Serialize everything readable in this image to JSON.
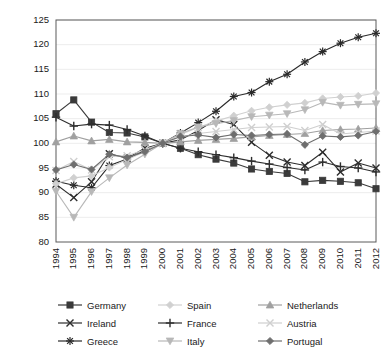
{
  "chart_data": {
    "type": "line",
    "title": "",
    "subtitle": "",
    "xlabel": "",
    "ylabel": "",
    "ylim": [
      80,
      125
    ],
    "yticks": [
      80,
      85,
      90,
      95,
      100,
      105,
      110,
      115,
      120,
      125
    ],
    "grid": true,
    "legend_position": "bottom",
    "legend_columns": 3,
    "x": [
      1994,
      1995,
      1996,
      1997,
      1998,
      1999,
      2000,
      2001,
      2002,
      2003,
      2004,
      2005,
      2006,
      2007,
      2008,
      2009,
      2010,
      2011,
      2012
    ],
    "categories": [
      "1994",
      "1995",
      "1996",
      "1997",
      "1998",
      "1999",
      "2000",
      "2001",
      "2002",
      "2003",
      "2004",
      "2005",
      "2006",
      "2007",
      "2008",
      "2009",
      "2010",
      "2011",
      "2012"
    ],
    "series": [
      {
        "name": "Germany",
        "marker": "square",
        "color": "#3a3a3a",
        "values": [
          106.0,
          108.8,
          104.3,
          102.2,
          102.1,
          101.3,
          100.0,
          99.0,
          97.7,
          96.8,
          96.0,
          94.8,
          94.3,
          93.9,
          92.2,
          92.5,
          92.3,
          92.0,
          90.8
        ]
      },
      {
        "name": "Ireland",
        "marker": "x",
        "color": "#2e2e2e",
        "values": [
          91.7,
          89.0,
          92.2,
          97.9,
          97.0,
          99.0,
          100.0,
          100.7,
          102.6,
          104.8,
          103.8,
          100.2,
          97.6,
          96.2,
          95.5,
          98.2,
          94.2,
          96.0,
          95.0
        ]
      },
      {
        "name": "Greece",
        "marker": "asterisk",
        "color": "#2a2a2a",
        "values": [
          92.3,
          91.5,
          91.0,
          95.5,
          96.8,
          98.6,
          100.0,
          102.1,
          104.2,
          106.5,
          109.5,
          110.3,
          112.5,
          114.0,
          116.5,
          118.6,
          120.3,
          121.5,
          122.3
        ]
      },
      {
        "name": "Spain",
        "marker": "diamond",
        "color": "#d0d0d0",
        "values": [
          91.8,
          93.0,
          93.4,
          95.1,
          96.7,
          98.3,
          100.0,
          101.8,
          103.2,
          104.5,
          105.6,
          106.6,
          107.3,
          107.8,
          108.2,
          109.1,
          109.4,
          109.6,
          110.2
        ]
      },
      {
        "name": "France",
        "marker": "plus",
        "color": "#2e2e2e",
        "values": [
          105.3,
          103.5,
          103.9,
          103.7,
          102.8,
          101.5,
          100.0,
          99.0,
          98.3,
          97.7,
          97.1,
          96.4,
          95.8,
          95.1,
          94.6,
          96.2,
          95.3,
          95.0,
          94.2
        ]
      },
      {
        "name": "Italy",
        "marker": "triangle-down",
        "color": "#b8b8b8",
        "values": [
          90.3,
          85.0,
          90.2,
          93.0,
          95.6,
          97.8,
          100.0,
          102.0,
          103.3,
          104.0,
          104.6,
          105.4,
          105.7,
          106.0,
          106.8,
          108.3,
          107.7,
          107.9,
          108.0
        ]
      },
      {
        "name": "Netherlands",
        "marker": "triangle-up",
        "color": "#a0a0a0",
        "values": [
          100.3,
          101.5,
          100.5,
          100.8,
          100.3,
          100.2,
          100.0,
          100.3,
          100.6,
          100.8,
          101.0,
          101.3,
          101.6,
          101.8,
          102.0,
          102.6,
          102.8,
          102.9,
          103.1
        ]
      },
      {
        "name": "Austria",
        "marker": "x-light",
        "color": "#cfcfcf",
        "values": [
          94.5,
          96.3,
          94.6,
          97.3,
          97.5,
          98.7,
          100.0,
          101.3,
          102.0,
          102.4,
          102.8,
          103.2,
          103.3,
          103.4,
          102.6,
          103.8,
          101.9,
          102.2,
          102.5
        ]
      },
      {
        "name": "Portugal",
        "marker": "diamond-dark",
        "color": "#6e6e6e",
        "values": [
          94.6,
          95.7,
          94.7,
          97.8,
          97.1,
          98.3,
          100.0,
          101.4,
          101.7,
          101.2,
          101.8,
          101.6,
          101.8,
          101.9,
          99.7,
          101.5,
          101.3,
          101.6,
          102.4
        ]
      }
    ]
  },
  "legend": {
    "entries": [
      {
        "label": "Germany"
      },
      {
        "label": "Spain"
      },
      {
        "label": "Netherlands"
      },
      {
        "label": "Ireland"
      },
      {
        "label": "France"
      },
      {
        "label": "Austria"
      },
      {
        "label": "Greece"
      },
      {
        "label": "Italy"
      },
      {
        "label": "Portugal"
      }
    ]
  }
}
